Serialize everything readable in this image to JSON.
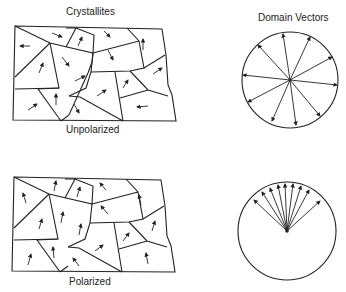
{
  "labels": {
    "crystallites": "Crystallites",
    "domain_vectors": "Domain Vectors",
    "unpolarized": "Unpolarized",
    "polarized": "Polarized"
  },
  "colors": {
    "ink": "#222222",
    "background": "#ffffff"
  },
  "panels": [
    {
      "state": "unpolarized",
      "grain_arrows": "random orientations",
      "vector_circle": "arrows spread over full 360 degrees (12 vectors)"
    },
    {
      "state": "polarized",
      "grain_arrows": "aligned roughly upward",
      "vector_circle": "arrows confined to upper fan (~9 vectors)"
    }
  ]
}
